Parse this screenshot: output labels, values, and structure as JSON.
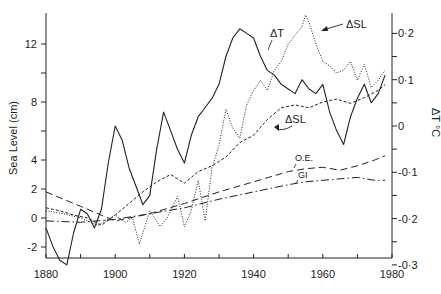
{
  "chart_data": {
    "type": "line",
    "title": "",
    "xlabel": "",
    "ylabel": "Sea Level (cm)",
    "y2label": "ΔT °C",
    "xlim": [
      1880,
      1980
    ],
    "ylim": [
      -2.8,
      14
    ],
    "y2lim": [
      -0.3,
      0.25
    ],
    "xticks": [
      1880,
      1890,
      1900,
      1910,
      1920,
      1930,
      1940,
      1950,
      1960,
      1970,
      1980
    ],
    "xtick_labels": [
      "1880",
      "1900",
      "1920",
      "1940",
      "1960",
      "1980"
    ],
    "yticks": [
      -2,
      0,
      2,
      4,
      6,
      8,
      10,
      12
    ],
    "ytick_labels": [
      "-2",
      "0",
      "2",
      "4",
      "8",
      "12"
    ],
    "y2ticks": [
      0.2,
      0.15,
      0.1,
      0.05,
      0,
      -0.05,
      -0.1,
      -0.15,
      -0.2,
      -0.25,
      -0.3
    ],
    "y2tick_labels": [
      "0·2",
      "0·1",
      "0",
      "-0·1",
      "-0·2",
      "-0·3"
    ],
    "grid": false,
    "legend": "none (inline annotations)",
    "series": [
      {
        "name": "ΔT",
        "axis": "right",
        "style": "solid",
        "x": [
          1880,
          1882,
          1884,
          1886,
          1888,
          1890,
          1892,
          1894,
          1896,
          1898,
          1900,
          1902,
          1904,
          1906,
          1908,
          1910,
          1912,
          1914,
          1916,
          1918,
          1920,
          1922,
          1924,
          1926,
          1928,
          1930,
          1932,
          1934,
          1936,
          1938,
          1940,
          1942,
          1944,
          1946,
          1948,
          1950,
          1952,
          1954,
          1956,
          1958,
          1960,
          1962,
          1964,
          1966,
          1968,
          1970,
          1972,
          1974,
          1976,
          1978
        ],
        "values": [
          -0.22,
          -0.26,
          -0.29,
          -0.3,
          -0.23,
          -0.18,
          -0.19,
          -0.22,
          -0.18,
          -0.08,
          0.0,
          -0.03,
          -0.09,
          -0.13,
          -0.17,
          -0.15,
          -0.05,
          0.03,
          -0.01,
          -0.05,
          -0.08,
          -0.02,
          0.02,
          0.04,
          0.06,
          0.09,
          0.15,
          0.19,
          0.21,
          0.2,
          0.19,
          0.15,
          0.12,
          0.11,
          0.09,
          0.08,
          0.07,
          0.1,
          0.08,
          0.07,
          0.09,
          0.03,
          -0.01,
          -0.04,
          0.02,
          0.06,
          0.09,
          0.05,
          0.07,
          0.11
        ]
      },
      {
        "name": "ΔSL (dotted)",
        "axis": "left",
        "style": "dotted",
        "x": [
          1880,
          1885,
          1890,
          1895,
          1900,
          1903,
          1905,
          1907,
          1910,
          1913,
          1915,
          1918,
          1920,
          1922,
          1924,
          1926,
          1928,
          1930,
          1932,
          1934,
          1936,
          1938,
          1940,
          1942,
          1944,
          1946,
          1948,
          1950,
          1952,
          1954,
          1955,
          1956,
          1958,
          1960,
          1962,
          1964,
          1966,
          1968,
          1970,
          1972,
          1974,
          1976,
          1978
        ],
        "values": [
          0.5,
          0.3,
          0.0,
          -0.5,
          0.2,
          -0.3,
          0.0,
          -1.8,
          0.5,
          -0.6,
          0.0,
          1.5,
          -0.6,
          0.5,
          2.6,
          -0.2,
          3.5,
          5.0,
          7.5,
          6.2,
          5.5,
          7.8,
          8.8,
          9.5,
          8.8,
          10.2,
          10.8,
          12.0,
          12.6,
          13.2,
          14.0,
          13.5,
          12.0,
          10.8,
          10.5,
          10.0,
          10.2,
          10.8,
          9.5,
          10.6,
          9.0,
          9.5,
          10.2
        ]
      },
      {
        "name": "ΔSL (dashed)",
        "axis": "left",
        "style": "dashed",
        "x": [
          1880,
          1884,
          1888,
          1892,
          1896,
          1900,
          1904,
          1908,
          1912,
          1916,
          1920,
          1924,
          1928,
          1932,
          1936,
          1940,
          1944,
          1948,
          1952,
          1956,
          1960,
          1964,
          1968,
          1972,
          1976,
          1978
        ],
        "values": [
          0.7,
          0.5,
          0.2,
          0.0,
          -0.5,
          0.2,
          1.0,
          1.8,
          2.5,
          3.0,
          2.4,
          3.2,
          3.6,
          4.2,
          5.2,
          5.7,
          6.8,
          7.6,
          7.8,
          7.6,
          8.0,
          8.2,
          7.9,
          8.3,
          8.8,
          9.2
        ]
      },
      {
        "name": "O.E.",
        "axis": "left",
        "style": "long-dash",
        "x": [
          1880,
          1890,
          1900,
          1910,
          1920,
          1930,
          1940,
          1950,
          1955,
          1960,
          1965,
          1970,
          1975,
          1978
        ],
        "values": [
          1.8,
          0.8,
          -0.2,
          0.3,
          1.0,
          1.8,
          2.5,
          3.2,
          3.4,
          3.5,
          3.3,
          3.6,
          4.0,
          4.3
        ]
      },
      {
        "name": "GI",
        "axis": "left",
        "style": "dash-dot",
        "x": [
          1880,
          1890,
          1900,
          1910,
          1920,
          1930,
          1940,
          1950,
          1955,
          1960,
          1965,
          1970,
          1975,
          1978
        ],
        "values": [
          -0.2,
          -0.3,
          -0.1,
          0.3,
          0.7,
          1.3,
          1.8,
          2.3,
          2.5,
          2.6,
          2.7,
          2.8,
          2.6,
          2.6
        ]
      }
    ],
    "annotations": [
      {
        "text": "ΔT",
        "near_year": 1942
      },
      {
        "text": "ΔSL",
        "near_year": 1957,
        "arrow": true
      },
      {
        "text": "ΔSL",
        "near_year": 1948,
        "arrow": true
      },
      {
        "text": "O.E.",
        "near_year": 1952
      },
      {
        "text": "GI",
        "near_year": 1952
      }
    ]
  },
  "labels": {
    "ylabel": "Sea Level (cm)",
    "y2label": "ΔT °C",
    "annot_dT": "ΔT",
    "annot_dSL_top": "ΔSL",
    "annot_dSL_mid": "ΔSL",
    "annot_OE": "O.E.",
    "annot_GI": "GI"
  }
}
